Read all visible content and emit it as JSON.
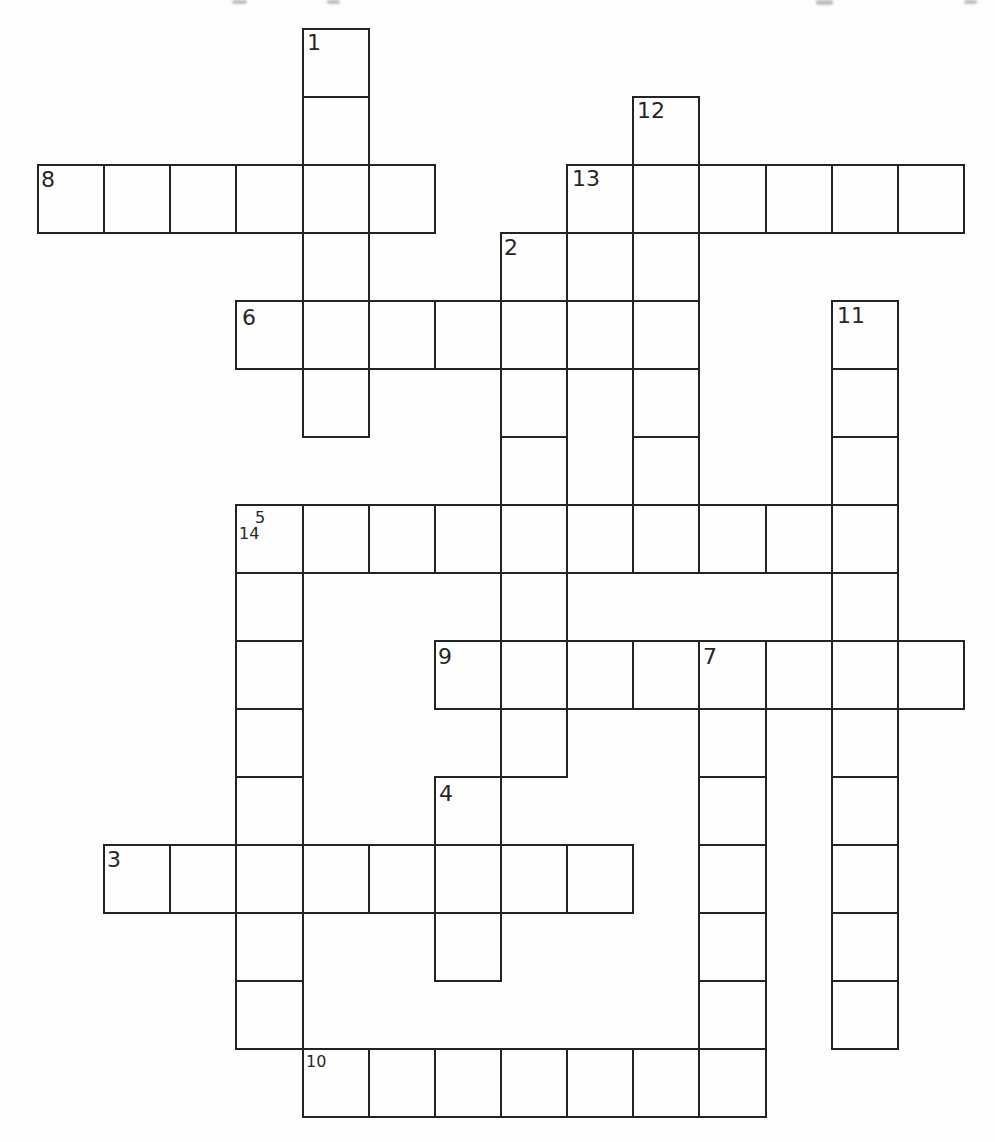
{
  "page": {
    "kind": "crossword-puzzle-grid",
    "background": "#fdfdfd",
    "line_color": "#232323",
    "number_color": "#262626"
  },
  "grid": {
    "origin_x": 37,
    "origin_y": 28,
    "cell_width": 66.14,
    "cell_height": 68
  },
  "words": {
    "across": [
      {
        "number": 8,
        "row": 2,
        "col": 0,
        "length": 6
      },
      {
        "number": 13,
        "row": 2,
        "col": 8,
        "length": 6
      },
      {
        "number": 6,
        "row": 4,
        "col": 3,
        "length": 7
      },
      {
        "number": 14,
        "row": 7,
        "col": 3,
        "length": 10
      },
      {
        "number": 9,
        "row": 9,
        "col": 6,
        "length": 8
      },
      {
        "number": 3,
        "row": 12,
        "col": 1,
        "length": 8
      },
      {
        "number": 10,
        "row": 15,
        "col": 4,
        "length": 7
      }
    ],
    "down": [
      {
        "number": 1,
        "row": 0,
        "col": 4,
        "length": 6
      },
      {
        "number": 12,
        "row": 1,
        "col": 9,
        "length": 7
      },
      {
        "number": 2,
        "row": 3,
        "col": 7,
        "length": 8
      },
      {
        "number": 11,
        "row": 4,
        "col": 12,
        "length": 11
      },
      {
        "number": 5,
        "row": 7,
        "col": 3,
        "length": 8
      },
      {
        "number": 7,
        "row": 9,
        "col": 10,
        "length": 7
      },
      {
        "number": 4,
        "row": 11,
        "col": 6,
        "length": 3
      }
    ]
  },
  "clue_numbers": [
    {
      "text": "1",
      "col": 4,
      "row": 0,
      "dx": 5,
      "dy": 4,
      "small": false
    },
    {
      "text": "2",
      "col": 7,
      "row": 3,
      "dx": 4,
      "dy": 5,
      "small": false
    },
    {
      "text": "3",
      "col": 1,
      "row": 12,
      "dx": 4,
      "dy": 5,
      "small": false
    },
    {
      "text": "4",
      "col": 6,
      "row": 11,
      "dx": 5,
      "dy": 7,
      "small": false
    },
    {
      "text": "5",
      "col": 3,
      "row": 7,
      "dx": 20,
      "dy": 6,
      "small": true
    },
    {
      "text": "6",
      "col": 3,
      "row": 4,
      "dx": 7,
      "dy": 7,
      "small": false
    },
    {
      "text": "7",
      "col": 10,
      "row": 9,
      "dx": 5,
      "dy": 6,
      "small": false
    },
    {
      "text": "8",
      "col": 0,
      "row": 2,
      "dx": 4,
      "dy": 5,
      "small": false
    },
    {
      "text": "9",
      "col": 6,
      "row": 9,
      "dx": 4,
      "dy": 6,
      "small": false
    },
    {
      "text": "10",
      "col": 4,
      "row": 15,
      "dx": 4,
      "dy": 6,
      "small": true
    },
    {
      "text": "11",
      "col": 12,
      "row": 4,
      "dx": 6,
      "dy": 5,
      "small": false
    },
    {
      "text": "12",
      "col": 9,
      "row": 1,
      "dx": 5,
      "dy": 4,
      "small": false
    },
    {
      "text": "13",
      "col": 8,
      "row": 2,
      "dx": 6,
      "dy": 4,
      "small": false
    },
    {
      "text": "14",
      "col": 3,
      "row": 7,
      "dx": 4,
      "dy": 22,
      "small": true
    }
  ],
  "scan_artifacts": [
    {
      "x": 232,
      "y": 0,
      "w": 15,
      "h": 4
    },
    {
      "x": 327,
      "y": 0,
      "w": 13,
      "h": 4
    },
    {
      "x": 816,
      "y": 0,
      "w": 17,
      "h": 5
    },
    {
      "x": 964,
      "y": 0,
      "w": 13,
      "h": 4
    }
  ]
}
